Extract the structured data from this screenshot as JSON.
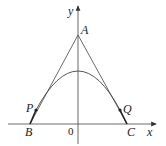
{
  "labels": {
    "y_axis": "y",
    "x_axis": "x",
    "A": "A",
    "P": "P",
    "Q": "Q",
    "B": "B",
    "C": "C",
    "origin": "0"
  },
  "colors": {
    "line": "#333333"
  }
}
